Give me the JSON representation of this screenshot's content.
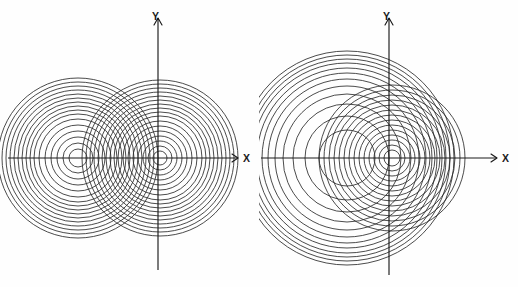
{
  "figure": {
    "background_color": "#fefefe",
    "line_color": "#2b2b2b",
    "axis_color": "#1a1a1a",
    "width": 518,
    "height": 287
  },
  "chart_data": {
    "type": "scatter",
    "xlabel": "X",
    "ylabel": "Y",
    "grid": false,
    "legend": null,
    "panels": [
      {
        "name": "left-panel",
        "description": "Two equal families of concentric circles with centers on the X axis, producing a symmetric two-lobe interference pattern",
        "origin": {
          "x": 158,
          "y": 158
        },
        "axes": {
          "x_axis": {
            "x1": 8,
            "y1": 158,
            "x2": 238,
            "y2": 158,
            "arrow": "right",
            "label": "X"
          },
          "y_axis": {
            "x1": 158,
            "y1": 270,
            "x2": 158,
            "y2": 18,
            "arrow": "up",
            "label": "Y"
          }
        },
        "families": [
          {
            "name": "left-source",
            "center": {
              "x": 78,
              "y": 158
            },
            "radii": [
              9,
              15,
              21,
              27,
              33,
              39,
              44,
              48,
              52,
              56,
              60,
              64,
              68,
              72,
              76,
              80
            ]
          },
          {
            "name": "right-source",
            "center": {
              "x": 160,
              "y": 158
            },
            "radii": [
              7,
              12,
              17,
              22,
              27,
              32,
              37,
              42,
              46,
              50,
              54,
              58,
              62,
              66,
              70,
              74,
              78
            ]
          }
        ]
      },
      {
        "name": "right-panel",
        "description": "A large family of concentric circles offset to the left of the origin overlapping a smaller family centered near the origin",
        "origin": {
          "x": 130,
          "y": 158
        },
        "axes": {
          "x_axis": {
            "x1": 2,
            "y1": 158,
            "x2": 238,
            "y2": 158,
            "arrow": "right",
            "label": "X"
          },
          "y_axis": {
            "x1": 130,
            "y1": 275,
            "x2": 130,
            "y2": 18,
            "arrow": "up",
            "label": "Y"
          }
        },
        "families": [
          {
            "name": "large-offset-source",
            "center": {
              "x": 88,
              "y": 158
            },
            "radii": [
              28,
              42,
              54,
              64,
              72,
              79,
              85,
              90,
              95,
              99,
              103,
              107
            ]
          },
          {
            "name": "small-origin-source",
            "center": {
              "x": 133,
              "y": 158
            },
            "radii": [
              8,
              13,
              18,
              23,
              28,
              33,
              38,
              43,
              48,
              53,
              58,
              63,
              68,
              73
            ]
          }
        ]
      }
    ]
  },
  "labels": {
    "left_panel": {
      "x": "X",
      "y": "Y"
    },
    "right_panel": {
      "x": "X",
      "y": "Y"
    }
  }
}
